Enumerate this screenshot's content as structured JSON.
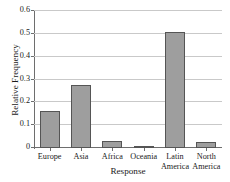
{
  "chart_data": {
    "type": "bar",
    "title": "",
    "xlabel": "Response",
    "ylabel": "Relative Frequency",
    "categories": [
      "Europe",
      "Asia",
      "Africa",
      "Oceania",
      "Latin\nAmerica",
      "North\nAmerica"
    ],
    "values": [
      0.16,
      0.275,
      0.03,
      0.007,
      0.51,
      0.028
    ],
    "ylim": [
      0,
      0.6
    ],
    "yticks": [
      0,
      0.1,
      0.2,
      0.3,
      0.4,
      0.5,
      0.6
    ],
    "ytick_labels": [
      "0",
      "0.1",
      "0.2",
      "0.3",
      "0.4",
      "0.5",
      "0.6"
    ],
    "grid": true,
    "grid_axis": "y",
    "legend": "none",
    "bar_color": "#9e9e9e",
    "bar_edge_color": "#555555",
    "grid_color": "#c9c9c9",
    "axis_color": "#6e6e6e"
  }
}
